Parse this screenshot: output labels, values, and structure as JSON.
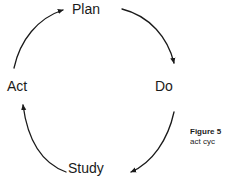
{
  "diagram": {
    "type": "cycle",
    "nodes": [
      {
        "id": "plan",
        "label": "Plan",
        "position": "top"
      },
      {
        "id": "do",
        "label": "Do",
        "position": "right"
      },
      {
        "id": "study",
        "label": "Study",
        "position": "bottom"
      },
      {
        "id": "act",
        "label": "Act",
        "position": "left"
      }
    ],
    "arrows": [
      {
        "id": "act-to-plan",
        "from": "act",
        "to": "plan",
        "direction": "clockwise",
        "arrowhead": "right"
      },
      {
        "id": "plan-to-do",
        "from": "plan",
        "to": "do",
        "direction": "clockwise",
        "arrowhead": "down"
      },
      {
        "id": "do-to-study",
        "from": "do",
        "to": "study",
        "direction": "clockwise",
        "arrowhead": "left"
      },
      {
        "id": "study-to-act",
        "from": "study",
        "to": "act",
        "direction": "clockwise",
        "arrowhead": "up"
      }
    ],
    "colors": {
      "stroke": "#1a1a1a",
      "text": "#1a1a1a",
      "background": "#ffffff",
      "caption_text": "#1c1c1c"
    }
  },
  "caption": {
    "line1": "Figure 5",
    "line2": "act cyc"
  }
}
